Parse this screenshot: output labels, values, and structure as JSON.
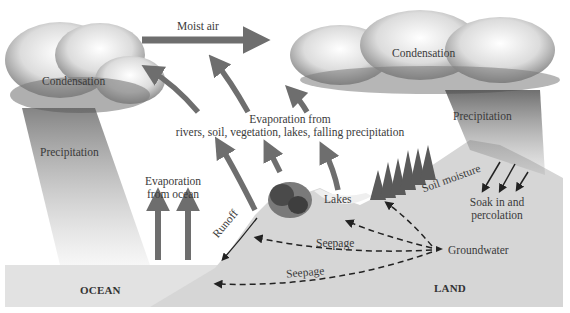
{
  "diagram": {
    "type": "water-cycle",
    "colors": {
      "arrow_gray": "#6e6e6e",
      "ocean": "#e2e2e2",
      "land": "#d6d6d6",
      "cloud_dark": "#5a5a5a",
      "text": "#3a3a3a",
      "lake": "#eeeeee"
    },
    "labels": {
      "moist_air": "Moist air",
      "condensation_left": "Condensation",
      "condensation_right": "Condensation",
      "precipitation_left": "Precipitation",
      "precipitation_right": "Precipitation",
      "evap_land_line1": "Evaporation from",
      "evap_land_line2": "rivers, soil, vegetation, lakes, falling precipitation",
      "evap_ocean_line1": "Evaporation",
      "evap_ocean_line2": "from ocean",
      "runoff": "Runoff",
      "lakes": "Lakes",
      "soil_moisture": "Soil moisture",
      "soak_line1": "Soak in and",
      "soak_line2": "percolation",
      "seepage_upper": "Seepage",
      "seepage_lower": "Seepage",
      "groundwater": "Groundwater",
      "ocean": "OCEAN",
      "land": "LAND"
    }
  }
}
